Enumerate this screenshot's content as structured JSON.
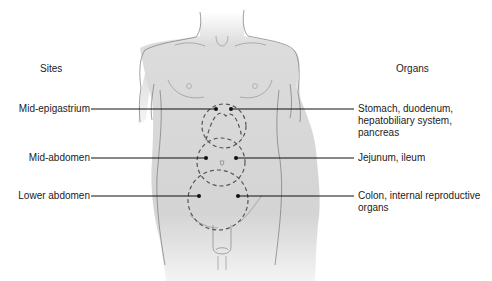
{
  "headings": {
    "sites": "Sites",
    "organs": "Organs"
  },
  "rows": [
    {
      "site": "Mid-epigastrium",
      "organs": [
        "Stomach, duodenum,",
        "hepatobiliary system,",
        "pancreas"
      ]
    },
    {
      "site": "Mid-abdomen",
      "organs": [
        "Jejunum, ileum"
      ]
    },
    {
      "site": "Lower abdomen",
      "organs": [
        "Colon, internal reproductive",
        "organs"
      ]
    }
  ],
  "colors": {
    "body_fill": "#d6d6d6",
    "outline": "#666666",
    "leader_line": "#111111",
    "dashed_circle": "#555555"
  }
}
